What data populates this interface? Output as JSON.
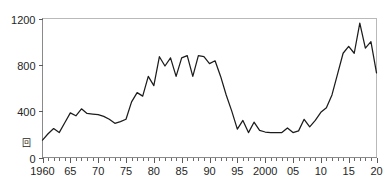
{
  "chart_data": {
    "type": "line",
    "title": "",
    "subtitle": "",
    "xlabel": "",
    "ylabel": "回",
    "ylabel_text": "回",
    "xlim": [
      1960,
      2020
    ],
    "ylim": [
      0,
      1200
    ],
    "grid": false,
    "legend": null,
    "y_ticks": [
      0,
      400,
      800,
      1200
    ],
    "y_tick_labels": [
      "0",
      "400",
      "800",
      "1200"
    ],
    "x_ticks": [
      1960,
      1965,
      1970,
      1975,
      1980,
      1985,
      1990,
      1995,
      2000,
      2005,
      2010,
      2015,
      2020
    ],
    "x_tick_labels": [
      "1960",
      "65",
      "70",
      "75",
      "80",
      "85",
      "90",
      "95",
      "2000",
      "05",
      "10",
      "15",
      "20"
    ],
    "x_minor_tick_step": 1,
    "series": [
      {
        "name": "series-1",
        "color": "#1c1c1c",
        "x": [
          1960,
          1961,
          1962,
          1963,
          1964,
          1965,
          1966,
          1967,
          1968,
          1969,
          1970,
          1971,
          1972,
          1973,
          1974,
          1975,
          1976,
          1977,
          1978,
          1979,
          1980,
          1981,
          1982,
          1983,
          1984,
          1985,
          1986,
          1987,
          1988,
          1989,
          1990,
          1991,
          1992,
          1993,
          1994,
          1995,
          1996,
          1997,
          1998,
          1999,
          2000,
          2001,
          2002,
          2003,
          2004,
          2005,
          2006,
          2007,
          2008,
          2009,
          2010,
          2011,
          2012,
          2013,
          2014,
          2015,
          2016,
          2017,
          2018,
          2019,
          2020
        ],
        "values": [
          150,
          205,
          250,
          215,
          300,
          385,
          360,
          420,
          380,
          375,
          370,
          355,
          330,
          295,
          310,
          330,
          480,
          560,
          530,
          700,
          620,
          870,
          790,
          860,
          700,
          860,
          880,
          700,
          880,
          870,
          810,
          835,
          700,
          540,
          400,
          245,
          320,
          215,
          305,
          235,
          220,
          215,
          215,
          215,
          255,
          215,
          230,
          330,
          265,
          320,
          390,
          430,
          540,
          720,
          900,
          960,
          900,
          1160,
          945,
          1000,
          730
        ]
      }
    ]
  },
  "axis": {
    "y_unit": "回"
  }
}
